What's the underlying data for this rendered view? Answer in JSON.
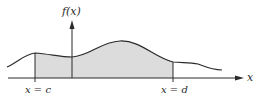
{
  "diagram": {
    "y_axis_label": "f(x)",
    "x_axis_label": "x",
    "left_bound_label": "x = c",
    "right_bound_label": "x = d",
    "colors": {
      "curve": "#2a2a2a",
      "axis": "#2a2a2a",
      "shaded_region": "#dcdcdc",
      "background": "#ffffff"
    }
  }
}
